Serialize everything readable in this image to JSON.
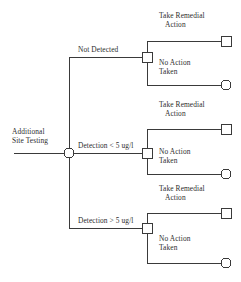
{
  "diagram": {
    "type": "decision-tree",
    "line_color": "#3a3a3a",
    "text_color": "#2e2e2e",
    "background": "#ffffff"
  },
  "root": {
    "label_line1": "Additional",
    "label_line2": "Site Testing",
    "node_shape": "circle"
  },
  "branches": [
    {
      "id": "not-detected",
      "label": "Not Detected",
      "node_shape": "square",
      "outcomes": [
        {
          "id": "remedial",
          "label_line1": "Take Remedial",
          "label_line2": "Action",
          "terminal_shape": "square"
        },
        {
          "id": "no-action",
          "label_line1": "No Action",
          "label_line2": "Taken",
          "terminal_shape": "circle"
        }
      ]
    },
    {
      "id": "detection-lt-5",
      "label": "Detection < 5 ug/l",
      "node_shape": "square",
      "outcomes": [
        {
          "id": "remedial",
          "label_line1": "Take Remedial",
          "label_line2": "Action",
          "terminal_shape": "square"
        },
        {
          "id": "no-action",
          "label_line1": "No Action",
          "label_line2": "Taken",
          "terminal_shape": "circle"
        }
      ]
    },
    {
      "id": "detection-gt-5",
      "label": "Detection > 5 ug/l",
      "node_shape": "square",
      "outcomes": [
        {
          "id": "remedial",
          "label_line1": "Take Remedial",
          "label_line2": "Action",
          "terminal_shape": "square"
        },
        {
          "id": "no-action",
          "label_line1": "No Action",
          "label_line2": "Taken",
          "terminal_shape": "circle"
        }
      ]
    }
  ]
}
